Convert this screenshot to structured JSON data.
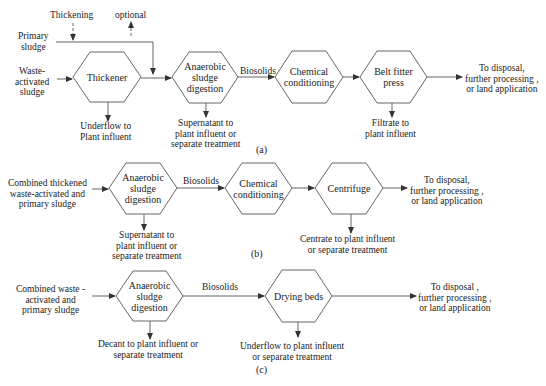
{
  "diagram_a": {
    "caption": "(a)",
    "inputs": {
      "thickening": "Thickening",
      "optional": "optional",
      "primary_sludge": [
        "Primary",
        "sludge"
      ],
      "waste_activated_sludge": [
        "Waste-",
        "activated",
        "sludge"
      ]
    },
    "nodes": [
      {
        "id": "thickener",
        "label": [
          "Thickener"
        ]
      },
      {
        "id": "anaerobic",
        "label": [
          "Anaerobic",
          "sludge",
          "digestion"
        ]
      },
      {
        "id": "chemical",
        "label": [
          "Chemical",
          "conditioning"
        ]
      },
      {
        "id": "belt",
        "label": [
          "Belt fitter",
          "press"
        ]
      }
    ],
    "edges": {
      "anaerobic_to_chemical": "Biosolids"
    },
    "outputs": {
      "thickener_under": [
        "Underflow to",
        "Plant influent"
      ],
      "anaerobic_under": [
        "Supernatant to",
        "plant influent or",
        "separate treatment"
      ],
      "belt_under": [
        "Filtrate to",
        "plant influent"
      ],
      "final": [
        "To disposal,",
        "further processing ,",
        "or land application"
      ]
    }
  },
  "diagram_b": {
    "caption": "(b)",
    "input": [
      "Combined thickened",
      "waste-activated and",
      "primary sludge"
    ],
    "nodes": [
      {
        "id": "anaerobic",
        "label": [
          "Anaerobic",
          "sludge",
          "digestion"
        ]
      },
      {
        "id": "chemical",
        "label": [
          "Chemical",
          "conditioning"
        ]
      },
      {
        "id": "centrifuge",
        "label": [
          "Centrifuge"
        ]
      }
    ],
    "edges": {
      "anaerobic_to_chemical": "Biosolids"
    },
    "outputs": {
      "anaerobic_under": [
        "Supernatant to",
        "plant influent or",
        "separate treatment"
      ],
      "centrifuge_under": [
        "Centrate to plant influent",
        "or separate treatment"
      ],
      "final": [
        "To disposal,",
        "further processing ,",
        "or land application"
      ]
    }
  },
  "diagram_c": {
    "caption": "(c)",
    "input": [
      "Combined  waste -",
      "activated and",
      "primary sludge"
    ],
    "nodes": [
      {
        "id": "anaerobic",
        "label": [
          "Anaerobic",
          "sludge",
          "digestion"
        ]
      },
      {
        "id": "drying",
        "label": [
          "Drying beds"
        ]
      }
    ],
    "edges": {
      "anaerobic_to_drying": "Biosolids"
    },
    "outputs": {
      "anaerobic_under": [
        "Decant to plant influent or",
        "separate treatment"
      ],
      "drying_under": [
        "Underflow to plant influent",
        "or separate treatment"
      ],
      "final": [
        "To disposal ,",
        "further processing ,",
        "or land application"
      ]
    }
  },
  "colors": {
    "stroke": "#444444",
    "text": "#222222",
    "background": "#ffffff"
  }
}
